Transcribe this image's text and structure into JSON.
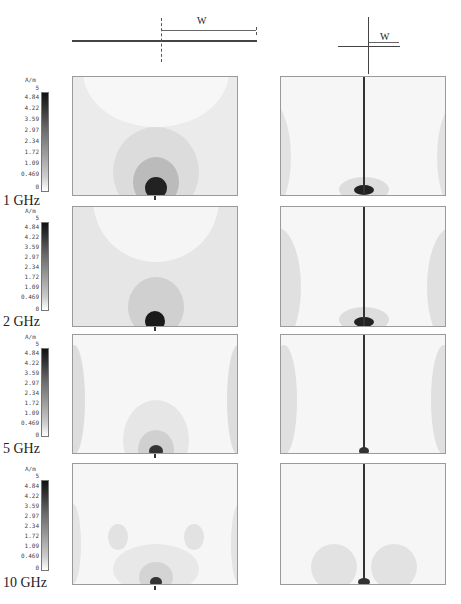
{
  "diagrams": {
    "left": {
      "label": "W",
      "description": "feed line with extension of width W (dashed vertical feed marker)"
    },
    "right": {
      "label": "W",
      "description": "feed with vertical conductor and extension W"
    }
  },
  "colorbar": {
    "unit": "A/m",
    "ticks": [
      "5",
      "4.84",
      "4.22",
      "3.59",
      "2.97",
      "2.34",
      "1.72",
      "1.09",
      "0.469",
      "0"
    ]
  },
  "rows": [
    {
      "frequency": "1 GHz"
    },
    {
      "frequency": "2 GHz"
    },
    {
      "frequency": "5 GHz"
    },
    {
      "frequency": "10 GHz"
    }
  ],
  "colors": {
    "max": "#111111",
    "min": "#ffffff",
    "frame": "#9a9a9a"
  }
}
